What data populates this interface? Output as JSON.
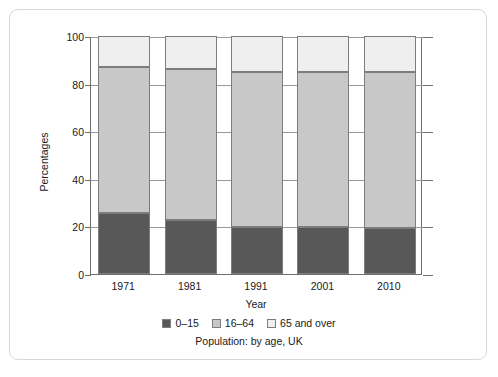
{
  "chart_data": {
    "type": "bar",
    "subtype": "stacked-bar-100",
    "title": "",
    "caption": "Population: by age, UK",
    "xlabel": "Year",
    "ylabel": "Percentages",
    "categories": [
      "1971",
      "1981",
      "1991",
      "2001",
      "2010"
    ],
    "ylim": [
      0,
      100
    ],
    "yticks": [
      0,
      20,
      40,
      60,
      80,
      100
    ],
    "ytick_labels": [
      "0",
      "20",
      "40",
      "60",
      "80",
      "100"
    ],
    "grid": true,
    "legend_position": "bottom",
    "series": [
      {
        "name": "0–15",
        "color": "#585858",
        "values": [
          25.5,
          22.5,
          19.8,
          19.8,
          19.2
        ]
      },
      {
        "name": "16–64",
        "color": "#c8c8c8",
        "values": [
          61.5,
          63.5,
          65.2,
          65.2,
          65.5
        ]
      },
      {
        "name": "65 and over",
        "color": "#efefef",
        "values": [
          13.0,
          14.0,
          15.0,
          15.0,
          15.3
        ]
      }
    ],
    "cumulative_tops": [
      [
        25.5,
        87.0,
        100
      ],
      [
        22.5,
        86.0,
        100
      ],
      [
        19.8,
        85.0,
        100
      ],
      [
        19.8,
        85.0,
        100
      ],
      [
        19.2,
        84.7,
        100
      ]
    ]
  },
  "legend": {
    "items": [
      {
        "label": "0–15",
        "color": "#585858"
      },
      {
        "label": "16–64",
        "color": "#c8c8c8"
      },
      {
        "label": "65 and over",
        "color": "#efefef"
      }
    ]
  },
  "axes": {
    "y_title": "Percentages",
    "x_title": "Year"
  },
  "colors": {
    "axis": "#6e6e6e",
    "grid": "#9a9a9a",
    "bar_outline": "#7d7d7d",
    "card_border": "#d9d9d9",
    "text": "#1a1a1a",
    "background": "#ffffff"
  }
}
